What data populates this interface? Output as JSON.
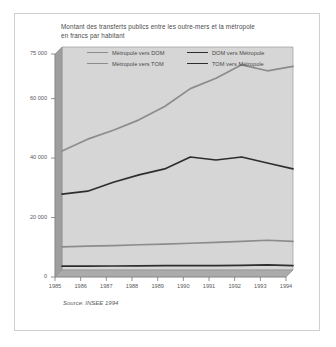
{
  "figure": {
    "title_line1": "Montant des transferts publics entre les outre-mers et la métropole",
    "title_line2": "en francs par habitant",
    "source": "Source: INSEE 1994",
    "border_color": "#cfcfcf",
    "background": "#ffffff"
  },
  "chart_data": {
    "type": "line",
    "title": "Montant des transferts publics entre les outre-mers et la métropole en francs par habitant",
    "subtitle": "en francs par habitant",
    "xlabel": "",
    "ylabel": "",
    "ylim": [
      0,
      75000
    ],
    "yticks": [
      0,
      20000,
      40000,
      60000,
      75000
    ],
    "ytick_labels": [
      "0",
      "20 000",
      "40 000",
      "60 000",
      "75 000"
    ],
    "grid": false,
    "legend_position": "inside-top",
    "categories": [
      1985,
      1986,
      1987,
      1988,
      1989,
      1990,
      1991,
      1992,
      1993,
      1994
    ],
    "xtick_labels": [
      "1985",
      "1986",
      "1987",
      "1988",
      "1989",
      "1990",
      "1991",
      "1992",
      "1993",
      "1994"
    ],
    "series": [
      {
        "name": "Métropole vers DOM",
        "color": "#8c8c8c",
        "width": 1.7,
        "values": [
          40000,
          44000,
          47000,
          50500,
          55000,
          61000,
          64500,
          69000,
          67000,
          68500
        ]
      },
      {
        "name": "DOM vers Métropole",
        "color": "#2e2e2e",
        "width": 1.7,
        "values": [
          25500,
          26500,
          29500,
          32000,
          34000,
          38000,
          37000,
          38000,
          36000,
          34000
        ]
      },
      {
        "name": "Métropole vers TOM",
        "color": "#8c8c8c",
        "width": 1.7,
        "values": [
          7800,
          8000,
          8200,
          8500,
          8700,
          9000,
          9300,
          9600,
          10000,
          9600
        ]
      },
      {
        "name": "TOM vers Métropole",
        "color": "#2e2e2e",
        "width": 1.7,
        "values": [
          1300,
          1300,
          1350,
          1400,
          1450,
          1500,
          1500,
          1550,
          1700,
          1500
        ]
      }
    ],
    "source": "Source: INSEE 1994",
    "plot_background": "#d4d4d4",
    "wall_color": "#9a9a9a",
    "floor_color": "#a8a8a8"
  },
  "legend": {
    "rows": [
      [
        {
          "label": "Métropole vers DOM",
          "color": "#8c8c8c"
        },
        {
          "label": "DOM vers Métropole",
          "color": "#2e2e2e"
        }
      ],
      [
        {
          "label": "Métropole vers TOM",
          "color": "#8c8c8c"
        },
        {
          "label": "TOM vers Métropole",
          "color": "#2e2e2e"
        }
      ]
    ]
  }
}
